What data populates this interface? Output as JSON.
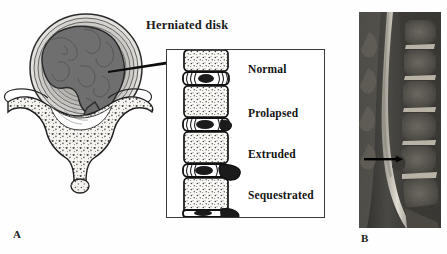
{
  "figure": {
    "title": "Herniated disk",
    "panels": [
      {
        "id": "A",
        "label": "A",
        "kind": "illustration",
        "description": "axial cross-section of lumbar vertebra with herniated disk and sagittal disk-stage column"
      },
      {
        "id": "B",
        "label": "B",
        "kind": "mri",
        "description": "sagittal T2 lumbar spine MRI with arrow marking disk herniation"
      }
    ]
  },
  "inset": {
    "stages": [
      {
        "name": "Normal",
        "order": 1
      },
      {
        "name": "Prolapsed",
        "order": 2
      },
      {
        "name": "Extruded",
        "order": 3
      },
      {
        "name": "Sequestrated",
        "order": 4
      }
    ]
  },
  "colors": {
    "ink": "#1a1a1a",
    "frame": "#3a3a3a",
    "nucleus": "#6e6e6e",
    "annulus": "#c9c9c9",
    "bone": "#f2f0ec",
    "background": "#ffffff",
    "mri_dark": "#1c1c1c",
    "mri_bright": "#e8e4da"
  }
}
